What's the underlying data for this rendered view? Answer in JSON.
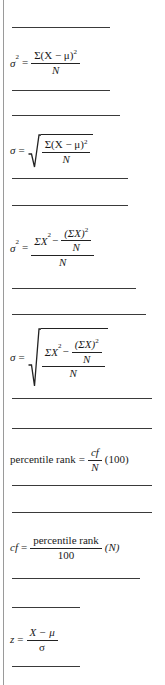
{
  "page": {
    "background_color": "#ffffff",
    "rule_color": "#3a3a3a",
    "text_color": "#1a1a1a",
    "width": 165,
    "height": 685
  },
  "symbols": {
    "sigma_lower": "σ",
    "sigma_upper": "Σ",
    "mu": "μ",
    "minus": "−",
    "equals": "=",
    "X": "X",
    "N": "N",
    "z": "z",
    "two": "2",
    "lparen": "(",
    "rparen": ")"
  },
  "formulas": [
    {
      "id": "population-variance-deviation",
      "lhs": "σ",
      "lhs_sup": "2",
      "relation": "=",
      "numerator": "Σ(X − μ)",
      "numerator_sup": "2",
      "denominator": "N",
      "plain": "σ² = Σ(X − μ)² / N"
    },
    {
      "id": "population-sd-deviation",
      "lhs": "σ",
      "relation": "=",
      "radical": true,
      "numerator": "Σ(X − μ)",
      "numerator_sup": "2",
      "denominator": "N",
      "plain": "σ = √(Σ(X − μ)² / N)"
    },
    {
      "id": "population-variance-raw-score",
      "lhs": "σ",
      "lhs_sup": "2",
      "relation": "=",
      "numerator_left": "ΣX",
      "numerator_left_sup": "2",
      "numerator_op": "−",
      "inner_numerator": "(ΣX)",
      "inner_numerator_sup": "2",
      "inner_denominator": "N",
      "denominator": "N",
      "plain": "σ² = [ΣX² − (ΣX)²/N] / N"
    },
    {
      "id": "population-sd-raw-score",
      "lhs": "σ",
      "relation": "=",
      "radical": true,
      "numerator_left": "ΣX",
      "numerator_left_sup": "2",
      "numerator_op": "−",
      "inner_numerator": "(ΣX)",
      "inner_numerator_sup": "2",
      "inner_denominator": "N",
      "denominator": "N",
      "plain": "σ = √([ΣX² − (ΣX)²/N] / N)"
    },
    {
      "id": "percentile-rank",
      "lhs": "percentile rank",
      "relation": "=",
      "numerator": "cf",
      "denominator": "N",
      "tail": "(100)",
      "plain": "percentile rank = cf/N (100)"
    },
    {
      "id": "cumulative-frequency",
      "lhs": "cf",
      "relation": "=",
      "numerator": "percentile rank",
      "denominator": "100",
      "tail": "(N)",
      "plain": "cf = (percentile rank / 100)(N)"
    },
    {
      "id": "z-score",
      "lhs": "z",
      "relation": "=",
      "numerator": "X − μ",
      "denominator": "σ",
      "plain": "z = (X − μ) / σ"
    }
  ],
  "dividers": [
    {
      "id": "rule-1",
      "top": 27,
      "left": 12,
      "width": 98
    },
    {
      "id": "rule-2",
      "top": 90,
      "left": 12,
      "width": 98
    },
    {
      "id": "rule-3",
      "top": 115,
      "left": 12,
      "width": 108
    },
    {
      "id": "rule-4",
      "top": 178,
      "left": 12,
      "width": 116
    },
    {
      "id": "rule-5",
      "top": 205,
      "left": 12,
      "width": 116
    },
    {
      "id": "rule-6",
      "top": 288,
      "left": 12,
      "width": 124
    },
    {
      "id": "rule-7",
      "top": 314,
      "left": 12,
      "width": 134
    },
    {
      "id": "rule-8",
      "top": 398,
      "left": 12,
      "width": 140
    },
    {
      "id": "rule-9",
      "top": 428,
      "left": 12,
      "width": 140
    },
    {
      "id": "rule-10",
      "top": 485,
      "left": 12,
      "width": 140
    },
    {
      "id": "rule-11",
      "top": 512,
      "left": 12,
      "width": 140
    },
    {
      "id": "rule-12",
      "top": 578,
      "left": 12,
      "width": 128
    },
    {
      "id": "rule-13",
      "top": 607,
      "left": 12,
      "width": 68
    },
    {
      "id": "rule-14",
      "top": 666,
      "left": 12,
      "width": 68
    }
  ]
}
